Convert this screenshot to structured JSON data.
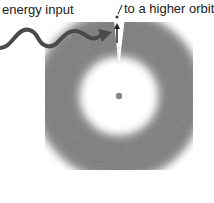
{
  "diagram": {
    "labels": {
      "energy_input": "energy input",
      "higher_orbit": "to a higher orbit"
    },
    "colors": {
      "cloud": "#7a7a7a",
      "arrow": "#4a4a4a",
      "nucleus": "#888888"
    },
    "icons": {
      "energy_arrow": "wavy-arrow-icon",
      "jump_arrow": "up-arrow-icon"
    }
  }
}
